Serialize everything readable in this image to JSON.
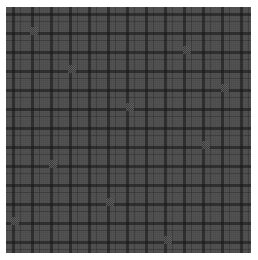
{
  "image": {
    "description": "Dark gray plaid / tartan fabric texture with repeating grid lines",
    "colors": {
      "base": "#4b4b4b",
      "dark_lines": "#2e2e2e",
      "light_cells": "#5a5a5a",
      "background": "#ffffff"
    },
    "pattern": {
      "type": "plaid",
      "repeat_px": 19
    }
  }
}
